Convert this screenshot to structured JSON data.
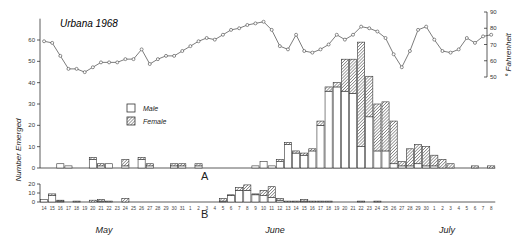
{
  "title": "Urbana 1968",
  "y_left_label": "Number Emerged",
  "y_right_label": "° Fahrenheit",
  "legend": {
    "male": "Male",
    "female": "Female"
  },
  "panels": {
    "a": "A",
    "b": "B"
  },
  "months": [
    "May",
    "June",
    "July"
  ],
  "chart_data": [
    {
      "type": "line",
      "title": "Urbana 1968",
      "ylabel": "° Fahrenheit",
      "ylim": [
        50,
        90
      ],
      "yticks": [
        50,
        60,
        70,
        80,
        90
      ],
      "x": [
        "May 14",
        "May 15",
        "May 16",
        "May 17",
        "May 18",
        "May 19",
        "May 20",
        "May 21",
        "May 22",
        "May 23",
        "May 24",
        "May 25",
        "May 26",
        "May 27",
        "May 28",
        "May 29",
        "May 30",
        "May 31",
        "Jun 1",
        "Jun 2",
        "Jun 3",
        "Jun 4",
        "Jun 5",
        "Jun 6",
        "Jun 7",
        "Jun 8",
        "Jun 9",
        "Jun 10",
        "Jun 11",
        "Jun 12",
        "Jun 13",
        "Jun 14",
        "Jun 15",
        "Jun 16",
        "Jun 17",
        "Jun 18",
        "Jun 19",
        "Jun 20",
        "Jun 21",
        "Jun 22",
        "Jun 23",
        "Jun 24",
        "Jun 25",
        "Jun 26",
        "Jun 27",
        "Jun 28",
        "Jun 29",
        "Jun 30",
        "Jul 1",
        "Jul 2",
        "Jul 3",
        "Jul 4",
        "Jul 5",
        "Jul 6",
        "Jul 7",
        "Jul 8"
      ],
      "values": [
        72,
        71,
        63,
        55,
        55,
        53,
        56,
        59,
        59,
        59,
        61,
        61,
        67,
        58,
        61,
        63,
        63,
        66,
        69,
        72,
        74,
        73,
        76,
        79,
        80,
        82,
        83,
        84,
        79,
        69,
        67,
        76,
        66,
        65,
        67,
        70,
        76,
        73,
        76,
        81,
        80,
        78,
        74,
        64,
        56,
        66,
        79,
        81,
        73,
        66,
        65,
        67,
        74,
        71,
        75,
        76
      ]
    },
    {
      "type": "bar",
      "title": "A",
      "ylabel": "Number Emerged",
      "ylim": [
        0,
        90
      ],
      "yticks": [
        0,
        10,
        20,
        30,
        40,
        50,
        60
      ],
      "stacked": true,
      "categories": [
        "May 14",
        "May 15",
        "May 16",
        "May 17",
        "May 18",
        "May 19",
        "May 20",
        "May 21",
        "May 22",
        "May 23",
        "May 24",
        "May 25",
        "May 26",
        "May 27",
        "May 28",
        "May 29",
        "May 30",
        "May 31",
        "Jun 1",
        "Jun 2",
        "Jun 3",
        "Jun 4",
        "Jun 5",
        "Jun 6",
        "Jun 7",
        "Jun 8",
        "Jun 9",
        "Jun 10",
        "Jun 11",
        "Jun 12",
        "Jun 13",
        "Jun 14",
        "Jun 15",
        "Jun 16",
        "Jun 17",
        "Jun 18",
        "Jun 19",
        "Jun 20",
        "Jun 21",
        "Jun 22",
        "Jun 23",
        "Jun 24",
        "Jun 25",
        "Jun 26",
        "Jun 27",
        "Jun 28",
        "Jun 29",
        "Jun 30",
        "Jul 1",
        "Jul 2",
        "Jul 3",
        "Jul 4",
        "Jul 5",
        "Jul 6",
        "Jul 7",
        "Jul 8"
      ],
      "series": [
        {
          "name": "Male",
          "values": [
            0,
            0,
            2,
            1,
            0,
            0,
            4,
            1,
            2,
            0,
            1,
            0,
            4,
            1,
            0,
            0,
            1,
            1,
            0,
            1,
            0,
            0,
            0,
            0,
            0,
            0,
            1,
            3,
            1,
            3,
            11,
            7,
            6,
            8,
            20,
            36,
            38,
            36,
            35,
            10,
            24,
            8,
            8,
            2,
            1,
            1,
            2,
            1,
            1,
            0,
            0,
            0,
            0,
            0,
            0,
            0
          ]
        },
        {
          "name": "Female",
          "values": [
            0,
            0,
            0,
            0,
            0,
            0,
            1,
            1,
            0,
            0,
            3,
            0,
            1,
            1,
            0,
            0,
            1,
            1,
            0,
            1,
            0,
            0,
            0,
            0,
            0,
            0,
            0,
            0,
            0,
            1,
            1,
            1,
            1,
            1,
            2,
            2,
            2,
            15,
            16,
            49,
            19,
            22,
            23,
            20,
            2,
            8,
            9,
            9,
            5,
            4,
            2,
            0,
            0,
            1,
            0,
            1
          ]
        }
      ]
    },
    {
      "type": "bar",
      "title": "B",
      "ylabel": "Number Emerged",
      "ylim": [
        0,
        20
      ],
      "yticks": [
        0,
        10,
        20
      ],
      "stacked": true,
      "categories": [
        "May 14",
        "May 15",
        "May 16",
        "May 17",
        "May 18",
        "May 19",
        "May 20",
        "May 21",
        "May 22",
        "May 23",
        "May 24",
        "May 25",
        "May 26",
        "May 27",
        "May 28",
        "May 29",
        "May 30",
        "May 31",
        "Jun 1",
        "Jun 2",
        "Jun 3",
        "Jun 4",
        "Jun 5",
        "Jun 6",
        "Jun 7",
        "Jun 8",
        "Jun 9",
        "Jun 10",
        "Jun 11",
        "Jun 12",
        "Jun 13",
        "Jun 14",
        "Jun 15",
        "Jun 16",
        "Jun 17",
        "Jun 18",
        "Jun 19",
        "Jun 20",
        "Jun 21",
        "Jun 22",
        "Jun 23",
        "Jun 24",
        "Jun 25",
        "Jun 26",
        "Jun 27",
        "Jun 28",
        "Jun 29",
        "Jun 30",
        "Jul 1",
        "Jul 2",
        "Jul 3",
        "Jul 4",
        "Jul 5",
        "Jul 6",
        "Jul 7",
        "Jul 8"
      ],
      "series": [
        {
          "name": "Male",
          "values": [
            3,
            7,
            1,
            0,
            0,
            0,
            0,
            1,
            0,
            0,
            0,
            0,
            0,
            0,
            0,
            0,
            0,
            0,
            0,
            0,
            0,
            0,
            1,
            7,
            13,
            13,
            8,
            7,
            5,
            2,
            0,
            0,
            1,
            0,
            0,
            0,
            0,
            0,
            0,
            0,
            0,
            0,
            0,
            0,
            0,
            0,
            0,
            0,
            0,
            0,
            0,
            0,
            0,
            0,
            0,
            0
          ]
        },
        {
          "name": "Female",
          "values": [
            0,
            2,
            1,
            0,
            1,
            0,
            2,
            2,
            1,
            0,
            4,
            0,
            0,
            0,
            0,
            0,
            0,
            0,
            0,
            0,
            0,
            0,
            3,
            1,
            3,
            6,
            1,
            6,
            12,
            2,
            1,
            1,
            2,
            1,
            1,
            1,
            0,
            0,
            0,
            1,
            0,
            1,
            0,
            0,
            0,
            0,
            0,
            0,
            0,
            0,
            0,
            0,
            0,
            0,
            0,
            0
          ]
        }
      ]
    }
  ],
  "day_labels": [
    "14",
    "15",
    "16",
    "17",
    "18",
    "19",
    "20",
    "21",
    "22",
    "23",
    "24",
    "25",
    "26",
    "27",
    "28",
    "29",
    "30",
    "31",
    "1",
    "2",
    "3",
    "4",
    "5",
    "6",
    "7",
    "8",
    "9",
    "10",
    "11",
    "12",
    "13",
    "14",
    "15",
    "16",
    "17",
    "18",
    "19",
    "20",
    "21",
    "22",
    "23",
    "24",
    "25",
    "26",
    "27",
    "28",
    "29",
    "30",
    "1",
    "2",
    "3",
    "4",
    "5",
    "6",
    "7",
    "8"
  ]
}
